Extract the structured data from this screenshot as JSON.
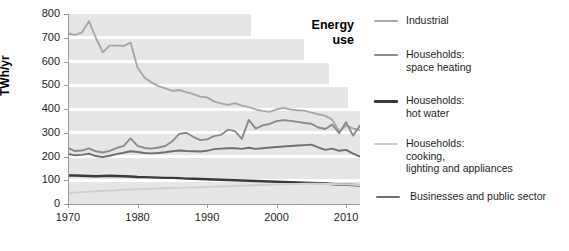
{
  "chart_data": {
    "type": "line",
    "title": "Energy use",
    "xlabel": "",
    "ylabel": "TWh/yr",
    "xlim": [
      1970,
      2012
    ],
    "ylim": [
      0,
      800
    ],
    "grid": true,
    "grid_style": "alternating horizontal grey bands",
    "legend_position": "right",
    "y_ticks": [
      0,
      100,
      200,
      300,
      400,
      500,
      600,
      700,
      800
    ],
    "x_ticks": [
      1970,
      1980,
      1990,
      2000,
      2010
    ],
    "x": [
      1970,
      1971,
      1972,
      1973,
      1974,
      1975,
      1976,
      1977,
      1978,
      1979,
      1980,
      1981,
      1982,
      1983,
      1984,
      1985,
      1986,
      1987,
      1988,
      1989,
      1990,
      1991,
      1992,
      1993,
      1994,
      1995,
      1996,
      1997,
      1998,
      1999,
      2000,
      2001,
      2002,
      2003,
      2004,
      2005,
      2006,
      2007,
      2008,
      2009,
      2010,
      2011,
      2012
    ],
    "series": [
      {
        "name": "Industrial",
        "color": "#a8a8a8",
        "values": [
          718,
          712,
          722,
          770,
          700,
          639,
          667,
          668,
          665,
          680,
          575,
          532,
          512,
          496,
          487,
          476,
          480,
          471,
          463,
          452,
          449,
          432,
          424,
          417,
          425,
          414,
          408,
          398,
          392,
          388,
          398,
          405,
          398,
          395,
          393,
          385,
          378,
          372,
          355,
          305,
          330,
          318,
          310
        ]
      },
      {
        "name": "Households: space heating",
        "color": "#8a8a8a",
        "values": [
          236,
          223,
          225,
          234,
          222,
          217,
          224,
          235,
          245,
          276,
          245,
          236,
          233,
          238,
          244,
          264,
          295,
          300,
          283,
          269,
          272,
          286,
          291,
          313,
          307,
          274,
          354,
          317,
          331,
          337,
          349,
          353,
          350,
          346,
          341,
          338,
          322,
          316,
          334,
          298,
          345,
          288,
          330
        ]
      },
      {
        "name": "Households: hot water",
        "color": "#3a3a3a",
        "values": [
          120,
          120,
          119,
          118,
          117,
          118,
          119,
          118,
          117,
          116,
          114,
          113,
          112,
          111,
          110,
          110,
          109,
          107,
          106,
          105,
          104,
          103,
          102,
          101,
          100,
          99,
          98,
          97,
          96,
          95,
          94,
          93,
          92,
          91,
          90,
          89,
          88,
          86,
          84,
          82,
          81,
          80,
          79
        ]
      },
      {
        "name": "Households: cooking, lighting and appliances",
        "color": "#cfcfcf",
        "values": [
          45,
          48,
          50,
          52,
          54,
          56,
          57,
          58,
          60,
          61,
          62,
          63,
          64,
          65,
          66,
          67,
          68,
          69,
          70,
          71,
          72,
          73,
          74,
          75,
          76,
          77,
          78,
          79,
          80,
          81,
          82,
          83,
          84,
          84,
          85,
          85,
          85,
          84,
          84,
          83,
          82,
          81,
          80
        ]
      },
      {
        "name": "Businesses and public sector",
        "color": "#6e6e6e",
        "values": [
          211,
          205,
          207,
          212,
          202,
          198,
          203,
          210,
          216,
          222,
          219,
          215,
          213,
          215,
          218,
          222,
          225,
          223,
          222,
          221,
          224,
          231,
          233,
          235,
          235,
          232,
          237,
          232,
          235,
          238,
          240,
          242,
          244,
          246,
          248,
          250,
          238,
          228,
          233,
          224,
          228,
          212,
          200
        ]
      }
    ]
  },
  "axis": {
    "y_label": "TWh/yr",
    "y_ticks": [
      "800",
      "700",
      "600",
      "500",
      "400",
      "300",
      "200",
      "100",
      "0"
    ],
    "x_ticks": [
      "1970",
      "1980",
      "1990",
      "2000",
      "2010"
    ]
  },
  "title": {
    "line1": "Energy",
    "line2": "use"
  },
  "legend": {
    "items": [
      {
        "label": "Industrial",
        "color": "#a8a8a8",
        "thickness": 2
      },
      {
        "label": "Households:\nspace heating",
        "color": "#8a8a8a",
        "thickness": 2
      },
      {
        "label": "Households:\nhot water",
        "color": "#3a3a3a",
        "thickness": 3
      },
      {
        "label": "Households:\ncooking,\nlighting and appliances",
        "color": "#cfcfcf",
        "thickness": 2
      },
      {
        "label": "Businesses and public sector",
        "color": "#6e6e6e",
        "thickness": 2
      }
    ]
  }
}
